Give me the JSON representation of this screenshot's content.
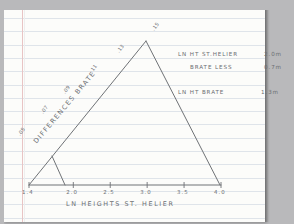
{
  "page": {
    "media": "ruled-notebook-paper",
    "ink_color": "#6b6e72",
    "margin_color": "#e8c4c4",
    "rule_color": "#dfe4ea"
  },
  "chart_data": {
    "type": "line",
    "title": "",
    "xlabel": "LN HEIGHTS ST. HELIER",
    "ylabel": "DIFFERENCES BRATE",
    "xlim": [
      1.4,
      4.0
    ],
    "grid": false,
    "legend": "none",
    "xticks": [
      "1.4",
      "2.0",
      "2.5",
      "3.0",
      "3.5",
      "4.0"
    ],
    "xtick_values": [
      1.4,
      2.0,
      2.5,
      3.0,
      3.5,
      4.0
    ],
    "series": [
      {
        "name": "rising-limb",
        "x": [
          1.4,
          1.7,
          2.0,
          2.35,
          2.7,
          3.1
        ],
        "y": [
          0.05,
          0.07,
          0.09,
          0.11,
          0.13,
          0.15
        ],
        "point_labels": [
          ".05",
          ".07",
          ".09",
          ".11",
          ".13",
          ".15"
        ]
      },
      {
        "name": "falling-limb",
        "x": [
          3.1,
          4.0
        ],
        "y": [
          0.15,
          0.0
        ],
        "point_labels": []
      },
      {
        "name": "baseline",
        "x": [
          1.4,
          4.0
        ],
        "y": [
          0.0,
          0.0
        ],
        "point_labels": []
      },
      {
        "name": "inner-recession",
        "x": [
          1.7,
          2.0
        ],
        "y": [
          0.07,
          0.0
        ],
        "point_labels": []
      }
    ]
  },
  "annotations": {
    "rows": [
      {
        "label": "LN HT ST.HELIER",
        "value": "2.0m"
      },
      {
        "label": "BRATE LESS",
        "value": "0.7m"
      },
      {
        "label": "LN HT BRATE",
        "value": "1.3m"
      }
    ]
  }
}
